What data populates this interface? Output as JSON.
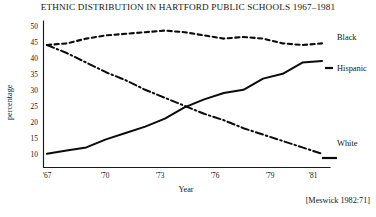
{
  "figure": {
    "title": "ETHNIC DISTRIBUTION IN HARTFORD PUBLIC SCHOOLS 1967–1981",
    "source_note": "[Meswick 1982:71]"
  },
  "axes": {
    "x_name": "Year",
    "y_name": "percentage",
    "x_tick_labels": [
      "'67",
      "'70",
      "'73",
      "'76",
      "'79",
      "'81"
    ],
    "y_tick_labels": [
      "50",
      "45",
      "40",
      "35",
      "30",
      "25",
      "20",
      "15",
      "10"
    ]
  },
  "legend": {
    "black_label": "Black",
    "hispanic_label": "Hispanic",
    "white_label": "White"
  },
  "chart_data": {
    "type": "line",
    "title": "ETHNIC DISTRIBUTION IN HARTFORD PUBLIC SCHOOLS 1967–1981",
    "xlabel": "Year",
    "ylabel": "percentage",
    "xlim": [
      1967,
      1981
    ],
    "ylim": [
      10,
      50
    ],
    "grid": false,
    "legend_position": "right-inline-labels",
    "x": [
      1967,
      1968,
      1969,
      1970,
      1971,
      1972,
      1973,
      1974,
      1975,
      1976,
      1977,
      1978,
      1979,
      1980,
      1981
    ],
    "x_tick_values": [
      1967,
      1970,
      1973,
      1976,
      1979,
      1981
    ],
    "x_tick_labels": [
      "'67",
      "'70",
      "'73",
      "'76",
      "'79",
      "'81"
    ],
    "y_tick_values": [
      50,
      45,
      40,
      35,
      30,
      25,
      20,
      15,
      10
    ],
    "series": [
      {
        "name": "Black",
        "line_style": "dashed",
        "color": "#0b0b0b",
        "values": [
          45.0,
          45.5,
          47.0,
          48.0,
          48.5,
          49.0,
          49.5,
          49.0,
          48.0,
          47.0,
          47.5,
          47.0,
          45.5,
          45.0,
          45.5
        ]
      },
      {
        "name": "Hispanic",
        "line_style": "solid",
        "color": "#0b0b0b",
        "values": [
          11.0,
          12.0,
          13.0,
          15.5,
          17.5,
          19.5,
          22.0,
          25.5,
          28.0,
          30.0,
          31.0,
          34.5,
          36.0,
          39.5,
          40.0
        ]
      },
      {
        "name": "White",
        "line_style": "dash-dot",
        "color": "#0b0b0b",
        "values": [
          45.0,
          42.5,
          39.5,
          36.5,
          34.0,
          31.0,
          28.5,
          26.0,
          23.5,
          21.5,
          19.0,
          17.0,
          15.0,
          13.0,
          11.0
        ]
      }
    ]
  }
}
